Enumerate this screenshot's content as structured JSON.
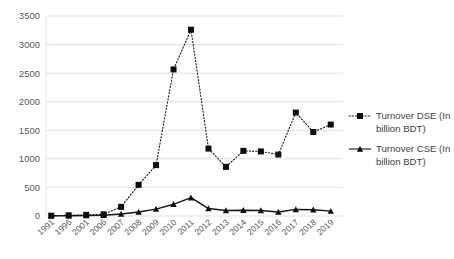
{
  "chart_data": {
    "type": "line",
    "title": "",
    "xlabel": "",
    "ylabel": "",
    "ylim": [
      0,
      3500
    ],
    "ytick_step": 500,
    "grid": true,
    "legend_position": "right",
    "categories": [
      "1991",
      "1996",
      "2001",
      "2006",
      "2007",
      "2008",
      "2009",
      "2010",
      "2011",
      "2012",
      "2013",
      "2014",
      "2015",
      "2016",
      "2017",
      "2018",
      "2019"
    ],
    "ytick_labels": [
      "0",
      "500",
      "1000",
      "1500",
      "2000",
      "2500",
      "3000",
      "3500"
    ],
    "series": [
      {
        "name": "Turnover DSE (In billion BDT)",
        "legend_line1": "Turnover DSE (In",
        "legend_line2": "billion BDT)",
        "marker": "square",
        "line_style": "dotted",
        "color": "#0d0d0d",
        "values": [
          5,
          12,
          20,
          30,
          160,
          545,
          890,
          2565,
          3260,
          1180,
          860,
          1140,
          1130,
          1075,
          1810,
          1470,
          1600
        ]
      },
      {
        "name": "Turnover CSE (In billion BDT)",
        "legend_line1": "Turnover CSE (In",
        "legend_line2": "billion BDT)",
        "marker": "triangle",
        "line_style": "solid",
        "color": "#0d0d0d",
        "values": [
          2,
          5,
          8,
          12,
          35,
          70,
          120,
          205,
          320,
          130,
          95,
          100,
          95,
          70,
          115,
          110,
          85
        ]
      }
    ]
  },
  "legend": {
    "items": [
      {
        "line1": "Turnover DSE (In",
        "line2": "billion BDT)",
        "marker": "square",
        "style": "dotted"
      },
      {
        "line1": "Turnover CSE (In",
        "line2": "billion BDT)",
        "marker": "triangle",
        "style": "solid"
      }
    ]
  },
  "colors": {
    "series": "#0d0d0d",
    "grid": "#d9d9d9",
    "tick_text": "#595959",
    "legend_text": "#3f3f3f",
    "background": "#ffffff"
  }
}
